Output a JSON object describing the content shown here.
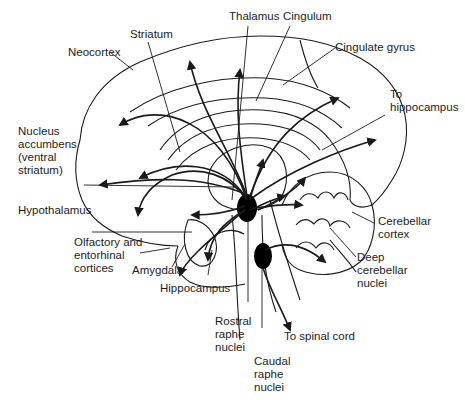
{
  "diagram": {
    "labels": {
      "thalamus": "Thalamus",
      "cingulum": "Cingulum",
      "striatum": "Striatum",
      "neocortex": "Neocortex",
      "cingulate_gyrus": "Cingulate gyrus",
      "to_hippocampus": "To\nhippocampus",
      "nucleus_accumbens": "Nucleus\naccumbens\n(ventral\nstriatum)",
      "hypothalamus": "Hypothalamus",
      "olfactory": "Olfactory and\nentorhinal\ncortices",
      "amygdala": "Amygdala",
      "hippocampus": "Hippocampus",
      "cerebellar_cortex": "Cerebellar\ncortex",
      "deep_cerebellar": "Deep\ncerebellar\nnuclei",
      "rostral_raphe": "Rostral\nraphe\nnuclei",
      "caudal_raphe": "Caudal\nraphe\nnuclei",
      "to_spinal_cord": "To spinal cord"
    },
    "colors": {
      "line": "#1a1a1a",
      "nucleus_fill": "#000000",
      "background": "#ffffff"
    }
  }
}
